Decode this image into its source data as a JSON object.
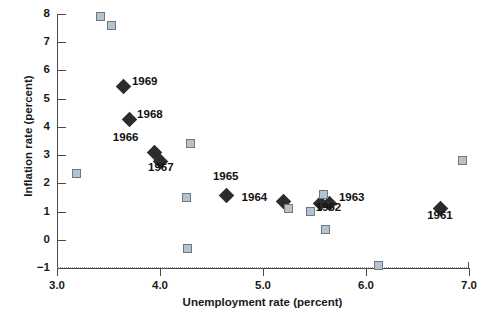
{
  "chart_data": {
    "type": "scatter",
    "title": "",
    "xlabel": "Unemployment rate (percent)",
    "ylabel": "Inflation rate (percent)",
    "xlim": [
      3.0,
      7.0
    ],
    "ylim": [
      -1,
      8
    ],
    "xticks": [
      "3.0",
      "4.0",
      "5.0",
      "6.0",
      "7.0"
    ],
    "xtick_values": [
      3.0,
      4.0,
      5.0,
      6.0,
      7.0
    ],
    "yticks": [
      "8",
      "7",
      "6",
      "5",
      "4",
      "3",
      "2",
      "1",
      "0",
      "−1"
    ],
    "ytick_values": [
      8,
      7,
      6,
      5,
      4,
      3,
      2,
      1,
      0,
      -1
    ],
    "grid": "dotted baseline at y = -1 only",
    "legend": "none",
    "series": [
      {
        "name": "labeled-years",
        "marker": "filled-diamond",
        "color": "#2c2c2c",
        "points": [
          {
            "label": "1969",
            "x": 3.65,
            "y": 5.43,
            "label_dx": 8,
            "label_dy": -6
          },
          {
            "label": "1968",
            "x": 3.7,
            "y": 4.25,
            "label_dx": 8,
            "label_dy": -6
          },
          {
            "label": "1966",
            "x": 3.95,
            "y": 3.08,
            "label_dx": -42,
            "label_dy": -16
          },
          {
            "label": "1967",
            "x": 4.0,
            "y": 2.76,
            "label_dx": -12,
            "label_dy": 5
          },
          {
            "label": "1965",
            "x": 4.65,
            "y": 1.57,
            "label_dx": -14,
            "label_dy": -19
          },
          {
            "label": "1964",
            "x": 5.2,
            "y": 1.37,
            "label_dx": -42,
            "label_dy": -4
          },
          {
            "label": "1963",
            "x": 5.65,
            "y": 1.27,
            "label_dx": 9,
            "label_dy": -7
          },
          {
            "label": "1962",
            "x": 5.56,
            "y": 1.3,
            "label_dx": -5,
            "label_dy": 4
          },
          {
            "label": "1961",
            "x": 6.72,
            "y": 1.11,
            "label_dx": -13,
            "label_dy": 7
          }
        ]
      },
      {
        "name": "unlabeled-observations",
        "marker": "open-square",
        "fill": "#b6c3cd",
        "edge": "#6c7a86",
        "points": [
          {
            "x": 3.42,
            "y": 7.91
          },
          {
            "x": 3.53,
            "y": 7.61
          },
          {
            "x": 3.19,
            "y": 2.34
          },
          {
            "x": 4.3,
            "y": 3.4
          },
          {
            "x": 4.26,
            "y": 1.5
          },
          {
            "x": 4.27,
            "y": -0.3
          },
          {
            "x": 5.25,
            "y": 1.12
          },
          {
            "x": 5.59,
            "y": 1.62
          },
          {
            "x": 5.46,
            "y": 1.01
          },
          {
            "x": 5.61,
            "y": 0.37
          },
          {
            "x": 6.94,
            "y": 2.81
          },
          {
            "x": 6.12,
            "y": -0.92
          }
        ]
      }
    ]
  },
  "axes": {
    "x_title": "Unemployment rate (percent)",
    "y_title": "Inflation rate (percent)"
  }
}
